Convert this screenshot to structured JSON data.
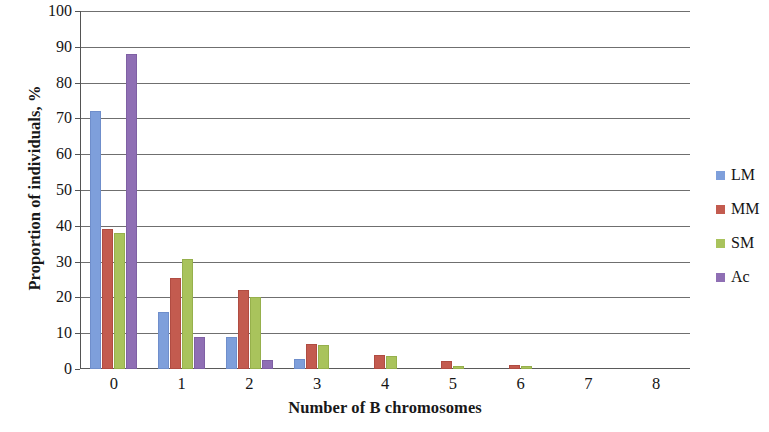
{
  "chart_data": {
    "type": "bar",
    "title": "",
    "subtitle": "",
    "xlabel": "Number of B chromosomes",
    "ylabel": "Proportion of individuals, %",
    "categories": [
      "0",
      "1",
      "2",
      "3",
      "4",
      "5",
      "6",
      "7",
      "8"
    ],
    "ylim": [
      0,
      100
    ],
    "ytick_step": 10,
    "yticks": [
      "100",
      "90",
      "80",
      "70",
      "60",
      "50",
      "40",
      "30",
      "20",
      "10",
      "0"
    ],
    "grid": "horizontal",
    "legend_position": "right",
    "series": [
      {
        "name": "LM",
        "color": "#7e9fdb",
        "values": [
          72,
          16,
          9,
          2.7,
          0,
          0,
          0,
          0,
          0
        ]
      },
      {
        "name": "MM",
        "color": "#c35b4f",
        "values": [
          39,
          25.5,
          22,
          7,
          3.8,
          2.3,
          1.0,
          0,
          0
        ]
      },
      {
        "name": "SM",
        "color": "#a9c35c",
        "values": [
          38,
          30.8,
          20,
          6.8,
          3.7,
          0.8,
          0.9,
          0,
          0
        ]
      },
      {
        "name": "Ac",
        "color": "#8f6fb4",
        "values": [
          88,
          9,
          2.5,
          0,
          0,
          0,
          0,
          0,
          0
        ]
      }
    ]
  }
}
